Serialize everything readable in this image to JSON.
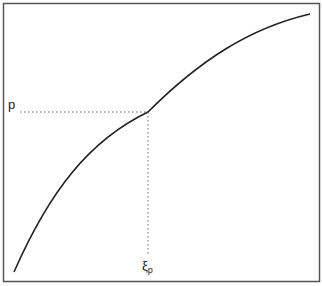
{
  "diagram": {
    "type": "quantile-function-curve",
    "y_label": "p",
    "x_label_main": "ξ",
    "x_label_sub": "p",
    "colors": {
      "curve": "#222222",
      "frame": "#555555",
      "guide": "#666666",
      "background": "#ffffff"
    }
  }
}
